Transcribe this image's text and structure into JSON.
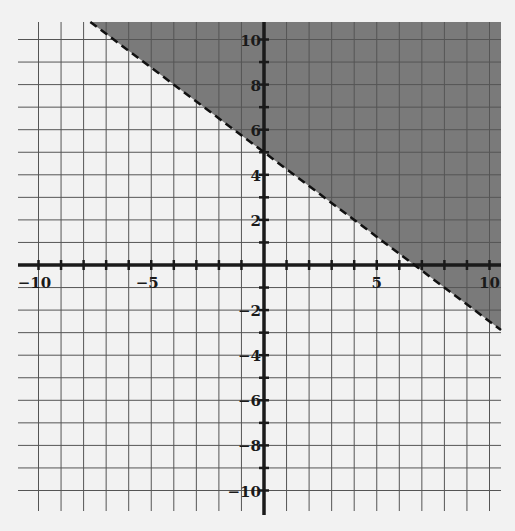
{
  "chart_data": {
    "type": "line",
    "subtype": "linear-inequality",
    "title": "",
    "xlabel": "",
    "ylabel": "",
    "xlim": [
      -10,
      10
    ],
    "ylim": [
      -10,
      10
    ],
    "grid": true,
    "grid_step": 1,
    "x_tick_labels": [
      {
        "value": -10,
        "label": "−10"
      },
      {
        "value": -5,
        "label": "−5"
      },
      {
        "value": 5,
        "label": "5"
      },
      {
        "value": 10,
        "label": "10"
      }
    ],
    "y_tick_labels": [
      {
        "value": 10,
        "label": "10"
      },
      {
        "value": 8,
        "label": "8"
      },
      {
        "value": 6,
        "label": "6"
      },
      {
        "value": 4,
        "label": "4"
      },
      {
        "value": 2,
        "label": "2"
      },
      {
        "value": -2,
        "label": "−2"
      },
      {
        "value": -4,
        "label": "−4"
      },
      {
        "value": -6,
        "label": "−6"
      },
      {
        "value": -8,
        "label": "−8"
      },
      {
        "value": -10,
        "label": "−10"
      }
    ],
    "boundary_line": {
      "equation": "y = -0.75x + 5",
      "slope": -0.75,
      "intercept": 5,
      "style": "dashed",
      "x_intercept": 6.67,
      "y_intercept": 5
    },
    "shaded_region": "above",
    "inequality": "y > -3/4 x + 5",
    "colors": {
      "shade": "#7a7a7a",
      "grid": "#555555",
      "axis": "#1a1a1a",
      "background": "#f2f2f2"
    }
  }
}
